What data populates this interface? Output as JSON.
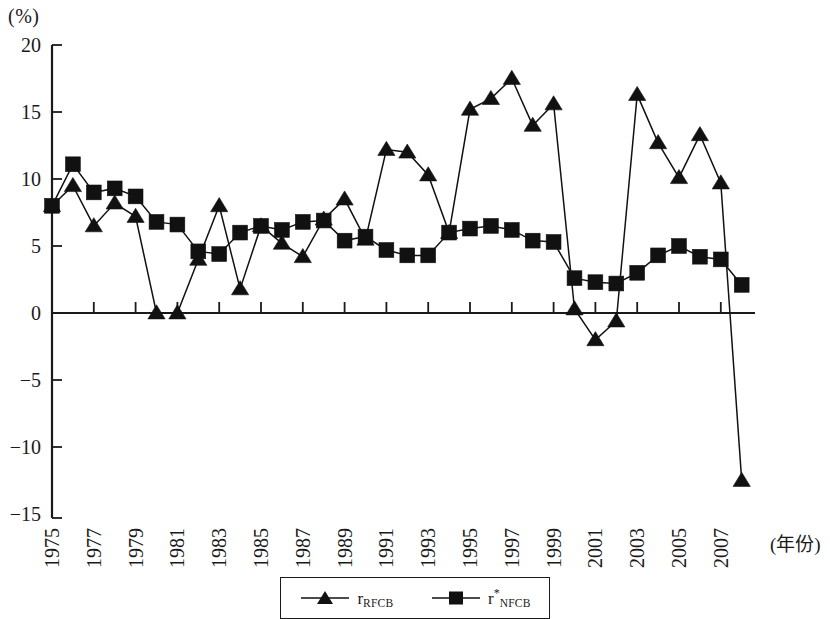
{
  "chart_data": {
    "type": "line",
    "title": "",
    "subtitle": "",
    "xlabel": "(年份)",
    "ylabel": "(%)",
    "ylim": [
      -15,
      20
    ],
    "xlim": [
      1975,
      2008
    ],
    "y_ticks": [
      20,
      15,
      10,
      5,
      0,
      -5,
      -10,
      -15
    ],
    "y_tick_labels": [
      "20",
      "15",
      "10",
      "5",
      "0",
      "−5",
      "−10",
      "−15"
    ],
    "x": [
      1975,
      1976,
      1977,
      1978,
      1979,
      1980,
      1981,
      1982,
      1983,
      1984,
      1985,
      1986,
      1987,
      1988,
      1989,
      1990,
      1991,
      1992,
      1993,
      1994,
      1995,
      1996,
      1997,
      1998,
      1999,
      2000,
      2001,
      2002,
      2003,
      2004,
      2005,
      2006,
      2007,
      2008
    ],
    "x_tick_values": [
      1975,
      1977,
      1979,
      1981,
      1983,
      1985,
      1987,
      1989,
      1991,
      1993,
      1995,
      1997,
      1999,
      2001,
      2003,
      2005,
      2007
    ],
    "x_tick_labels": [
      "1975",
      "1977",
      "1979",
      "1981",
      "1983",
      "1985",
      "1987",
      "1989",
      "1991",
      "1993",
      "1995",
      "1997",
      "1999",
      "2001",
      "2003",
      "2005",
      "2007"
    ],
    "grid": false,
    "legend_position": "bottom-center",
    "series": [
      {
        "name": "r_RFCB",
        "label_base": "r",
        "label_sub": "RFCB",
        "label_sup": "",
        "marker": "triangle",
        "color": "#111111",
        "values": [
          8.0,
          9.5,
          6.5,
          8.2,
          7.2,
          0.0,
          0.0,
          4.0,
          8.0,
          1.8,
          6.5,
          5.2,
          4.2,
          7.0,
          8.5,
          5.5,
          12.2,
          12.0,
          10.3,
          6.0,
          15.2,
          16.0,
          17.5,
          14.0,
          15.6,
          0.3,
          -2.0,
          -0.6,
          16.3,
          12.7,
          10.1,
          13.3,
          9.7,
          -12.5
        ]
      },
      {
        "name": "r*_NFCB",
        "label_base": "r",
        "label_sub": "NFCB",
        "label_sup": "*",
        "marker": "square",
        "color": "#111111",
        "values": [
          8.0,
          11.1,
          9.0,
          9.3,
          8.7,
          6.8,
          6.6,
          4.6,
          4.4,
          6.0,
          6.5,
          6.2,
          6.8,
          6.9,
          5.4,
          5.7,
          4.7,
          4.3,
          4.3,
          6.0,
          6.3,
          6.5,
          6.2,
          5.4,
          5.3,
          2.6,
          2.3,
          2.2,
          3.0,
          4.3,
          5.0,
          4.2,
          4.0,
          2.1
        ]
      }
    ]
  },
  "axis": {
    "y_unit": "(%)",
    "x_title": "(年份)"
  },
  "legend": {
    "entries": [
      {
        "marker": "triangle",
        "base": "r",
        "sub": "RFCB",
        "sup": ""
      },
      {
        "marker": "square",
        "base": "r",
        "sub": "NFCB",
        "sup": "*"
      }
    ]
  }
}
